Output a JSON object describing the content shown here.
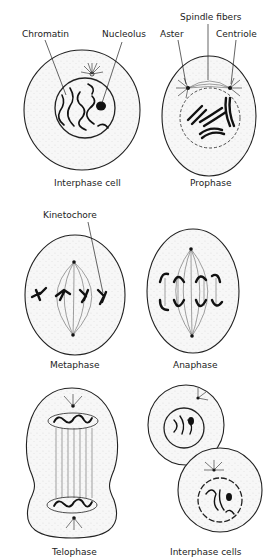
{
  "figure": {
    "panels": [
      {
        "id": "interphase",
        "caption": "Interphase cell",
        "labels": [
          "Chromatin",
          "Nucleolus"
        ]
      },
      {
        "id": "prophase",
        "caption": "Prophase",
        "labels": [
          "Spindle fibers",
          "Aster",
          "Centriole"
        ]
      },
      {
        "id": "metaphase",
        "caption": "Metaphase",
        "labels": [
          "Kinetochore"
        ]
      },
      {
        "id": "anaphase",
        "caption": "Anaphase",
        "labels": []
      },
      {
        "id": "telophase",
        "caption": "Telophase",
        "labels": []
      },
      {
        "id": "interphase-cells",
        "caption": "Interphase cells",
        "labels": []
      }
    ]
  },
  "labels": {
    "chromatin": "Chromatin",
    "nucleolus": "Nucleolus",
    "spindle_fibers": "Spindle fibers",
    "aster": "Aster",
    "centriole": "Centriole",
    "kinetochore": "Kinetochore"
  },
  "captions": {
    "interphase": "Interphase cell",
    "prophase": "Prophase",
    "metaphase": "Metaphase",
    "anaphase": "Anaphase",
    "telophase": "Telophase",
    "interphase_cells": "Interphase cells"
  },
  "colors": {
    "ink": "#222222",
    "cytoplasm": "#f7f7f7",
    "background": "#ffffff"
  }
}
